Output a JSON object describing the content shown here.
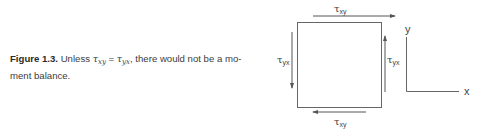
{
  "caption": {
    "figure_label": "Figure 1.3.",
    "text_before": " Unless ",
    "lhs_symbol": "τ",
    "lhs_sub": "xy",
    "equals": " = ",
    "rhs_symbol": "τ",
    "rhs_sub": "yx",
    "text_after": ", there would not be a mo-ment balance."
  },
  "diagram": {
    "top_label": {
      "symbol": "τ",
      "sub": "xy"
    },
    "bottom_label": {
      "symbol": "τ",
      "sub": "xy"
    },
    "left_label": {
      "symbol": "τ",
      "sub": "yx"
    },
    "right_label": {
      "symbol": "τ",
      "sub": "yx"
    },
    "axis_y_label": "y",
    "axis_x_label": "x",
    "stroke_color": "#555555"
  }
}
